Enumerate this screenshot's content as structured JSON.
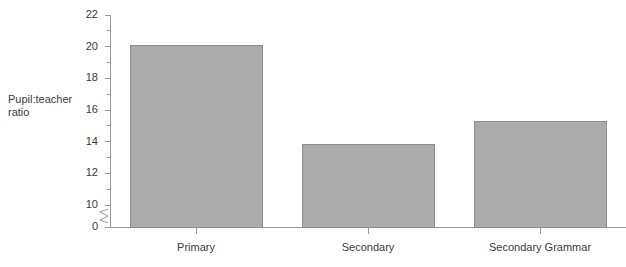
{
  "chart_data": {
    "type": "bar",
    "title": "",
    "subtitle": "",
    "xlabel": "",
    "ylabel": "Pupil:teacher\nratio",
    "categories": [
      "Primary",
      "Secondary",
      "Secondary Grammar"
    ],
    "values": [
      20.1,
      13.8,
      15.3
    ],
    "series": [
      {
        "name": "Pupil:teacher ratio",
        "values": [
          20.1,
          13.8,
          15.3
        ]
      }
    ],
    "ylim": [
      0,
      22
    ],
    "axis_break": {
      "present": true,
      "between": [
        0,
        10
      ],
      "symbol": "zigzag"
    },
    "ytick_labels": [
      "22",
      "20",
      "18",
      "16",
      "14",
      "12",
      "10",
      "0"
    ],
    "ytick_values": [
      22,
      20,
      18,
      16,
      14,
      12,
      10,
      0
    ],
    "yminor_tick_values": [
      21,
      19,
      17,
      15,
      13,
      11
    ],
    "grid": false,
    "legend": false,
    "legend_position": "none",
    "bar_fill_color": "#ababab",
    "bar_border_color": "#8f8f8f",
    "axis_color": "#9a9a9a",
    "text_color": "#3b3b3b",
    "background_color": "#ffffff"
  }
}
